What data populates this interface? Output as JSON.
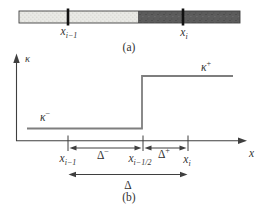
{
  "figure": {
    "panel_a": {
      "caption": "(a)",
      "tick_labels": [
        {
          "base": "x",
          "sub": "i−1"
        },
        {
          "base": "x",
          "sub": "i"
        }
      ]
    },
    "panel_b": {
      "caption": "(b)",
      "y_axis_label": "κ",
      "x_axis_label": "x",
      "level_left": {
        "base": "κ",
        "sup": "−"
      },
      "level_right": {
        "base": "κ",
        "sup": "+"
      },
      "axis_tick_labels": [
        {
          "base": "x",
          "sub": "i−1"
        },
        {
          "base": "x",
          "sub": "i−1/2"
        },
        {
          "base": "x",
          "sub": "i"
        }
      ],
      "interval_left": {
        "base": "Δ",
        "sup": "−"
      },
      "interval_right": {
        "base": "Δ",
        "sup": "+"
      },
      "interval_full": "Δ"
    },
    "colors": {
      "line": "#3f3f3f",
      "step_line": "#7e7e7e",
      "bar_dark": "#5c5c5c",
      "bar_light": "#e9e9e5",
      "text": "#333333",
      "tick": "#111111"
    }
  }
}
